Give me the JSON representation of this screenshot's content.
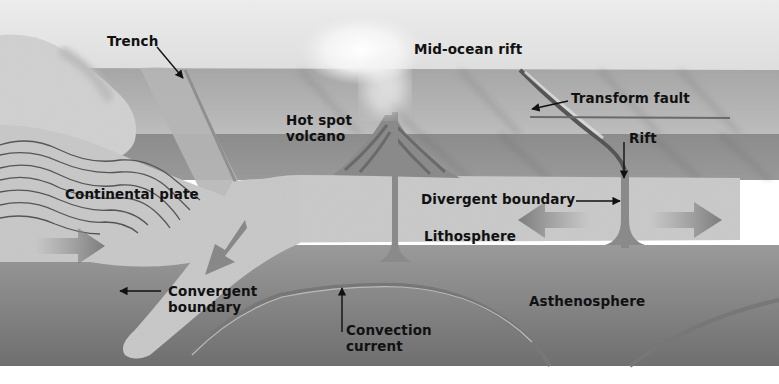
{
  "diagram": {
    "labels": {
      "trench": "Trench",
      "mid_ocean_rift": "Mid-ocean rift",
      "transform_fault": "Transform fault",
      "hot_spot_volcano_1": "Hot spot",
      "hot_spot_volcano_2": "volcano",
      "rift": "Rift",
      "continental_plate": "Continental plate",
      "divergent_boundary": "Divergent boundary",
      "lithosphere": "Lithosphere",
      "convergent_boundary_1": "Convergent",
      "convergent_boundary_2": "boundary",
      "asthenosphere": "Asthenosphere",
      "convection_current_1": "Convection",
      "convection_current_2": "current"
    },
    "colors": {
      "sky": "#e6e6e6",
      "ocean_surface": "#a9a9a9",
      "ocean_deep": "#8e8e8e",
      "lithosphere": "#c4c4c4",
      "asthenosphere": "#8a8a8a",
      "magma": "#7a7a7a",
      "label_text": "#111111"
    }
  }
}
